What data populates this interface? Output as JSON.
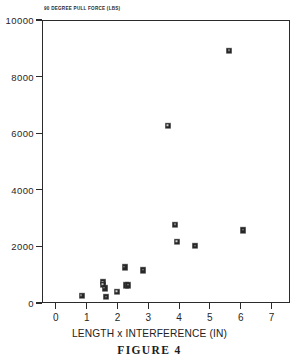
{
  "figure": {
    "caption": "FIGURE 4"
  },
  "chart_data": {
    "type": "scatter",
    "title": "90 DEGREE PULL FORCE (LBS)",
    "xlabel": "LENGTH x INTERFERENCE (IN)",
    "ylabel": "",
    "xlim": [
      -0.45,
      7.6
    ],
    "ylim": [
      0,
      10000
    ],
    "grid": false,
    "legend": null,
    "xticks": [
      "0",
      "1",
      "2",
      "3",
      "4",
      "5",
      "6",
      "7"
    ],
    "xtick_values": [
      0,
      1,
      2,
      3,
      4,
      5,
      6,
      7
    ],
    "yticks": [
      "0",
      "2000",
      "4000",
      "6000",
      "8000",
      "10000"
    ],
    "ytick_values": [
      0,
      2000,
      4000,
      6000,
      8000,
      10000
    ],
    "marker": "filled-square",
    "marker_color": "#272727",
    "points": [
      {
        "x": 0.8,
        "y": 290
      },
      {
        "x": 1.5,
        "y": 780
      },
      {
        "x": 1.5,
        "y": 680
      },
      {
        "x": 1.55,
        "y": 560
      },
      {
        "x": 1.6,
        "y": 250
      },
      {
        "x": 1.95,
        "y": 430
      },
      {
        "x": 2.2,
        "y": 1290
      },
      {
        "x": 2.25,
        "y": 670
      },
      {
        "x": 2.32,
        "y": 660
      },
      {
        "x": 2.8,
        "y": 1200
      },
      {
        "x": 3.6,
        "y": 6300
      },
      {
        "x": 3.85,
        "y": 2800
      },
      {
        "x": 3.9,
        "y": 2200
      },
      {
        "x": 4.5,
        "y": 2050
      },
      {
        "x": 5.6,
        "y": 8950
      },
      {
        "x": 6.05,
        "y": 2600
      }
    ]
  }
}
